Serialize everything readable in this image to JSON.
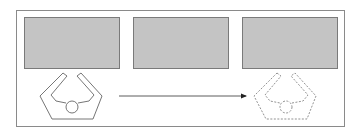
{
  "figure": {
    "frame": {
      "x": 16,
      "y": 10,
      "width": 328,
      "height": 116,
      "stroke": "#8a8a8a"
    },
    "panels": [
      {
        "id": "panel-1",
        "x": 24,
        "y": 17,
        "width": 95,
        "height": 51,
        "fill": "#c4c4c4",
        "stroke": "#7a7a7a"
      },
      {
        "id": "panel-2",
        "x": 133,
        "y": 17,
        "width": 95,
        "height": 51,
        "fill": "#c4c4c4",
        "stroke": "#7a7a7a"
      },
      {
        "id": "panel-3",
        "x": 242,
        "y": 17,
        "width": 95,
        "height": 51,
        "fill": "#c4c4c4",
        "stroke": "#7a7a7a"
      }
    ],
    "arrow": {
      "x1": 119,
      "y1": 96,
      "x2": 246,
      "y2": 96,
      "stroke": "#333333"
    },
    "shapes": [
      {
        "id": "shape-solid",
        "style": "solid",
        "offset_x": 0,
        "stroke": "#666666"
      },
      {
        "id": "shape-dashed",
        "style": "dashed",
        "offset_x": 214,
        "stroke": "#777777"
      }
    ]
  }
}
